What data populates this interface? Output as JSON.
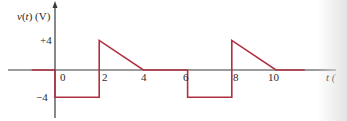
{
  "chart_data": {
    "type": "line",
    "title": "",
    "ylabel_var": "v",
    "ylabel_arg": "t",
    "ylabel_unit": "(V)",
    "xlabel": "t (",
    "x_ticks": [
      {
        "value": 0,
        "label": "0"
      },
      {
        "value": 2,
        "label": "2"
      },
      {
        "value": 4,
        "label": "4"
      },
      {
        "value": 6,
        "label": "6"
      },
      {
        "value": 8,
        "label": "8"
      },
      {
        "value": 10,
        "label": "10"
      }
    ],
    "y_ticks": [
      {
        "value": 4,
        "label": "+4"
      },
      {
        "value": -4,
        "label": "−4"
      }
    ],
    "xlim": [
      -1.05,
      12.8
    ],
    "ylim": [
      -4.4,
      4.0
    ],
    "grid": false,
    "legend": null,
    "series": [
      {
        "name": "v(t)",
        "color": "#b03040",
        "points": [
          [
            -1.05,
            0
          ],
          [
            0,
            0
          ],
          [
            0,
            -4
          ],
          [
            2,
            -4
          ],
          [
            2,
            4
          ],
          [
            4,
            0
          ],
          [
            6,
            0
          ],
          [
            6,
            -4
          ],
          [
            8,
            -4
          ],
          [
            8,
            4
          ],
          [
            10,
            0
          ],
          [
            11.3,
            0
          ]
        ]
      }
    ]
  },
  "layout": {
    "axis_color": "#333333",
    "line_color": "#b03040"
  }
}
